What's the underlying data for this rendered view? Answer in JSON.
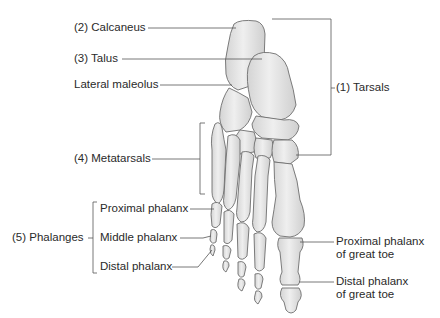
{
  "diagram": {
    "labels": {
      "calcaneus": "(2) Calcaneus",
      "talus": "(3) Talus",
      "lateral_maleolus": "Lateral maleolus",
      "tarsals": "(1) Tarsals",
      "metatarsals": "(4) Metatarsals",
      "phalanges": "(5) Phalanges",
      "proximal_phalanx": "Proximal phalanx",
      "middle_phalanx": "Middle phalanx",
      "distal_phalanx": "Distal phalanx",
      "proximal_phalanx_great_toe_line1": "Proximal phalanx",
      "proximal_phalanx_great_toe_line2": "of great toe",
      "distal_phalanx_great_toe_line1": "Distal phalanx",
      "distal_phalanx_great_toe_line2": "of great toe"
    },
    "colors": {
      "bone_fill": "#e6e6e6",
      "bone_shade": "#c8c8c8",
      "bone_outline": "#6e6e6e",
      "leader_line": "#555555",
      "text": "#2a2a2a",
      "background": "#ffffff"
    }
  }
}
